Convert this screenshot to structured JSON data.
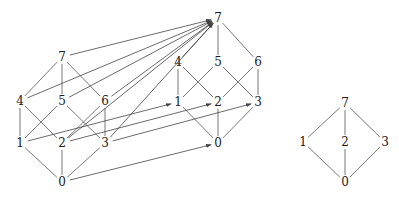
{
  "figure": {
    "title": "",
    "background_color": "#ffffff",
    "stroke_color": "#555555",
    "label_color": "#1a1a1a",
    "width": 399,
    "height": 198
  },
  "diagrams": [
    {
      "id": "front-cube",
      "name": "front-boolean-lattice",
      "nodes": [
        {
          "id": "f0",
          "label": "0",
          "x": 62,
          "y": 182
        },
        {
          "id": "f1",
          "label": "1",
          "x": 20,
          "y": 143
        },
        {
          "id": "f2",
          "label": "2",
          "x": 62,
          "y": 143
        },
        {
          "id": "f3",
          "label": "3",
          "x": 105,
          "y": 143
        },
        {
          "id": "f4",
          "label": "4",
          "x": 20,
          "y": 101
        },
        {
          "id": "f5",
          "label": "5",
          "x": 62,
          "y": 101
        },
        {
          "id": "f6",
          "label": "6",
          "x": 105,
          "y": 101
        },
        {
          "id": "f7",
          "label": "7",
          "x": 62,
          "y": 57
        }
      ],
      "edges": [
        [
          "f0",
          "f1"
        ],
        [
          "f0",
          "f2"
        ],
        [
          "f0",
          "f3"
        ],
        [
          "f1",
          "f4"
        ],
        [
          "f1",
          "f5"
        ],
        [
          "f2",
          "f4"
        ],
        [
          "f2",
          "f6"
        ],
        [
          "f3",
          "f5"
        ],
        [
          "f3",
          "f6"
        ],
        [
          "f4",
          "f7"
        ],
        [
          "f5",
          "f7"
        ],
        [
          "f6",
          "f7"
        ]
      ]
    },
    {
      "id": "back-cube",
      "name": "back-boolean-lattice",
      "nodes": [
        {
          "id": "b0",
          "label": "0",
          "x": 218,
          "y": 143
        },
        {
          "id": "b1",
          "label": "1",
          "x": 178,
          "y": 102
        },
        {
          "id": "b2",
          "label": "2",
          "x": 218,
          "y": 102
        },
        {
          "id": "b3",
          "label": "3",
          "x": 258,
          "y": 102
        },
        {
          "id": "b4",
          "label": "4",
          "x": 178,
          "y": 62
        },
        {
          "id": "b5",
          "label": "5",
          "x": 218,
          "y": 62
        },
        {
          "id": "b6",
          "label": "6",
          "x": 258,
          "y": 62
        },
        {
          "id": "b7",
          "label": "7",
          "x": 218,
          "y": 18
        }
      ],
      "edges": [
        [
          "b0",
          "b1"
        ],
        [
          "b0",
          "b2"
        ],
        [
          "b0",
          "b3"
        ],
        [
          "b1",
          "b4"
        ],
        [
          "b1",
          "b5"
        ],
        [
          "b2",
          "b4"
        ],
        [
          "b2",
          "b6"
        ],
        [
          "b3",
          "b5"
        ],
        [
          "b3",
          "b6"
        ],
        [
          "b4",
          "b7"
        ],
        [
          "b5",
          "b7"
        ],
        [
          "b6",
          "b7"
        ]
      ]
    },
    {
      "id": "right-diamond",
      "name": "right-quotient-lattice",
      "nodes": [
        {
          "id": "r0",
          "label": "0",
          "x": 345,
          "y": 182
        },
        {
          "id": "r1",
          "label": "1",
          "x": 303,
          "y": 142
        },
        {
          "id": "r2",
          "label": "2",
          "x": 345,
          "y": 142
        },
        {
          "id": "r3",
          "label": "3",
          "x": 385,
          "y": 142
        },
        {
          "id": "r7",
          "label": "7",
          "x": 345,
          "y": 103
        }
      ],
      "edges": [
        [
          "r0",
          "r1"
        ],
        [
          "r0",
          "r2"
        ],
        [
          "r0",
          "r3"
        ],
        [
          "r1",
          "r7"
        ],
        [
          "r2",
          "r7"
        ],
        [
          "r3",
          "r7"
        ]
      ]
    }
  ],
  "mapping_arrows": [
    {
      "from": "f0",
      "to": "b0",
      "label": "0 to 0"
    },
    {
      "from": "f1",
      "to": "b1",
      "label": "1 to 1"
    },
    {
      "from": "f2",
      "to": "b2",
      "label": "2 to 2"
    },
    {
      "from": "f3",
      "to": "b3",
      "label": "3 to 3"
    },
    {
      "from": "f4",
      "to": "b7",
      "label": "4 to 7"
    },
    {
      "from": "f5",
      "to": "b7",
      "label": "5 to 7"
    },
    {
      "from": "f6",
      "to": "b7",
      "label": "6 to 7"
    },
    {
      "from": "f7",
      "to": "b7",
      "label": "7 to 7"
    },
    {
      "from": "f2b",
      "to": "b7",
      "label": "2 to 7"
    },
    {
      "from": "f3b",
      "to": "b7",
      "label": "3 to 7"
    }
  ]
}
